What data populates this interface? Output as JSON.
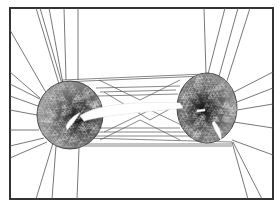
{
  "figure": {
    "kind": "unstructured triangular mesh around two airfoil elements",
    "width": 280,
    "height": 210,
    "background": "#ffffff",
    "frame": {
      "x": 10,
      "y": 8,
      "w": 263,
      "h": 191,
      "stroke": "#333333",
      "stroke_width": 2
    },
    "line_color": "#555555",
    "dense_color": "#2a2a2a",
    "clusters": [
      {
        "name": "left-cluster",
        "cx": 70,
        "cy": 115,
        "rx": 33,
        "ry": 34,
        "core_cx": 80,
        "core_cy": 118
      },
      {
        "name": "right-cluster",
        "cx": 207,
        "cy": 108,
        "rx": 30,
        "ry": 35,
        "core_cx": 203,
        "core_cy": 110
      }
    ],
    "airfoils": [
      {
        "name": "main-airfoil",
        "path": "M80,116 C95,104 140,101 180,103 L183,108 C150,112 110,114 84,121 Z"
      },
      {
        "name": "left-flap",
        "path": "M66,126 C70,118 76,114 80,113 C76,119 72,125 67,130 Z"
      },
      {
        "name": "right-flap",
        "path": "M214,121 C220,128 222,134 221,140 C217,134 214,128 212,123 Z"
      },
      {
        "name": "right-slot",
        "path": "M197,110 L205,109 L205,111 L197,112 Z"
      }
    ],
    "rays": [
      [
        40,
        8,
        62,
        84
      ],
      [
        36,
        8,
        59,
        84
      ],
      [
        49,
        8,
        63,
        84
      ],
      [
        64,
        8,
        66,
        80
      ],
      [
        78,
        8,
        78,
        80
      ],
      [
        10,
        30,
        48,
        96
      ],
      [
        10,
        72,
        40,
        98
      ],
      [
        10,
        84,
        42,
        100
      ],
      [
        10,
        96,
        38,
        106
      ],
      [
        10,
        110,
        37,
        115
      ],
      [
        10,
        130,
        39,
        130
      ],
      [
        10,
        146,
        44,
        138
      ],
      [
        10,
        158,
        47,
        142
      ],
      [
        36,
        199,
        53,
        143
      ],
      [
        52,
        199,
        56,
        146
      ],
      [
        77,
        199,
        79,
        148
      ],
      [
        204,
        8,
        206,
        74
      ],
      [
        225,
        8,
        208,
        74
      ],
      [
        238,
        8,
        218,
        80
      ],
      [
        250,
        8,
        226,
        84
      ],
      [
        273,
        72,
        234,
        92
      ],
      [
        273,
        88,
        237,
        102
      ],
      [
        273,
        104,
        237,
        110
      ],
      [
        273,
        128,
        234,
        122
      ],
      [
        273,
        155,
        232,
        140
      ],
      [
        248,
        199,
        232,
        142
      ],
      [
        262,
        199,
        233,
        142
      ]
    ],
    "bands": [
      [
        62,
        80,
        205,
        74
      ],
      [
        62,
        82,
        204,
        76
      ],
      [
        96,
        88,
        180,
        86
      ],
      [
        100,
        92,
        176,
        90
      ],
      [
        98,
        96,
        178,
        94
      ],
      [
        84,
        138,
        232,
        142
      ],
      [
        78,
        144,
        232,
        144
      ],
      [
        56,
        146,
        232,
        146
      ],
      [
        80,
        136,
        200,
        136
      ],
      [
        90,
        132,
        190,
        132
      ],
      [
        100,
        128,
        180,
        128
      ],
      [
        104,
        92,
        150,
        120
      ],
      [
        150,
        120,
        200,
        92
      ],
      [
        104,
        132,
        150,
        110
      ],
      [
        150,
        110,
        196,
        132
      ],
      [
        99,
        80,
        140,
        100
      ],
      [
        140,
        100,
        180,
        80
      ],
      [
        100,
        140,
        140,
        120
      ],
      [
        140,
        120,
        180,
        140
      ]
    ]
  }
}
